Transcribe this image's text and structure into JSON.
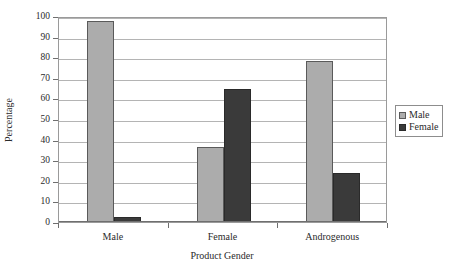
{
  "chart_data": {
    "type": "bar",
    "title": "",
    "xlabel": "Product Gender",
    "ylabel": "Percentage",
    "categories": [
      "Male",
      "Female",
      "Androgenous"
    ],
    "series": [
      {
        "name": "Male",
        "color": "#acacac",
        "values": [
          97.5,
          36.5,
          78.0
        ]
      },
      {
        "name": "Female",
        "color": "#3a3a3a",
        "values": [
          2.5,
          64.5,
          24.0
        ]
      }
    ],
    "ylim": [
      0,
      100
    ],
    "ytick_step": 10,
    "yticks": [
      0,
      10,
      20,
      30,
      40,
      50,
      60,
      70,
      80,
      90,
      100
    ],
    "ytick_labels": [
      "0",
      "10",
      "20",
      "30",
      "40",
      "50",
      "60",
      "70",
      "80",
      "90",
      "100"
    ],
    "grid": true,
    "grid_axis": "y",
    "legend_position": "right",
    "legend_entries": [
      "Male",
      "Female"
    ]
  }
}
